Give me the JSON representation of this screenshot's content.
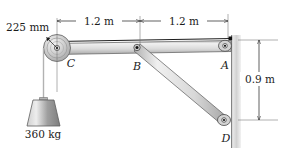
{
  "figure": {
    "background_color": "#ffffff"
  },
  "dimensions": {
    "pulley_radius": "225 mm",
    "span_left": "1.2 m",
    "span_right": "1.2 m",
    "wall_height": "0.9 m"
  },
  "joints": {
    "a": "A",
    "b": "B",
    "c": "C",
    "d": "D"
  },
  "load": {
    "mass": "360 kg"
  },
  "colors": {
    "member_fill": "#d9d9d9",
    "member_edge": "#4a4a4a",
    "wall_fill": "#cfcfcf",
    "line": "#1c1c1c",
    "pulley_fill": "#c9c9c9",
    "block_fill": "#a8a8a8"
  }
}
